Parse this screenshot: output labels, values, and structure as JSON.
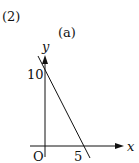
{
  "problem_number": "(2)",
  "subfigure_label": "(a)",
  "axes": {
    "x_label": "x",
    "y_label": "y",
    "origin_label": "O"
  },
  "ticks": {
    "y_intercept_label": "10",
    "x_intercept_label": "5"
  },
  "line": {
    "description": "straight line through (0,10) and (5,0)",
    "y_intercept": 10,
    "x_intercept": 5,
    "color": "#111111"
  }
}
